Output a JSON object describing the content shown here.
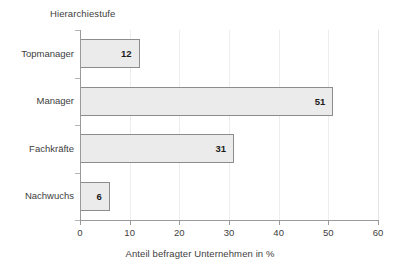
{
  "chart_data": {
    "type": "bar",
    "orientation": "horizontal",
    "title": "Hierarchiestufe",
    "categories": [
      "Topmanager",
      "Manager",
      "Fachkräfte",
      "Nachwuchs"
    ],
    "values": [
      12,
      51,
      31,
      6
    ],
    "data_labels": [
      "12",
      "51",
      "31",
      "6"
    ],
    "xlabel": "Anteil befragter Unternehmen in %",
    "ylabel": "",
    "xlim": [
      0,
      60
    ],
    "xticks": [
      0,
      10,
      20,
      30,
      40,
      50,
      60
    ],
    "xtick_labels": [
      "0",
      "10",
      "20",
      "30",
      "40",
      "50",
      "60"
    ],
    "grid": "vertical",
    "legend": "none",
    "colors": {
      "bar_fill": "#ebebeb",
      "bar_border": "#8c8c8c",
      "gridline": "#ededed",
      "axis": "#9a9a9a",
      "text": "#404040",
      "value_text": "#1c1c1c",
      "background": "#ffffff"
    }
  }
}
